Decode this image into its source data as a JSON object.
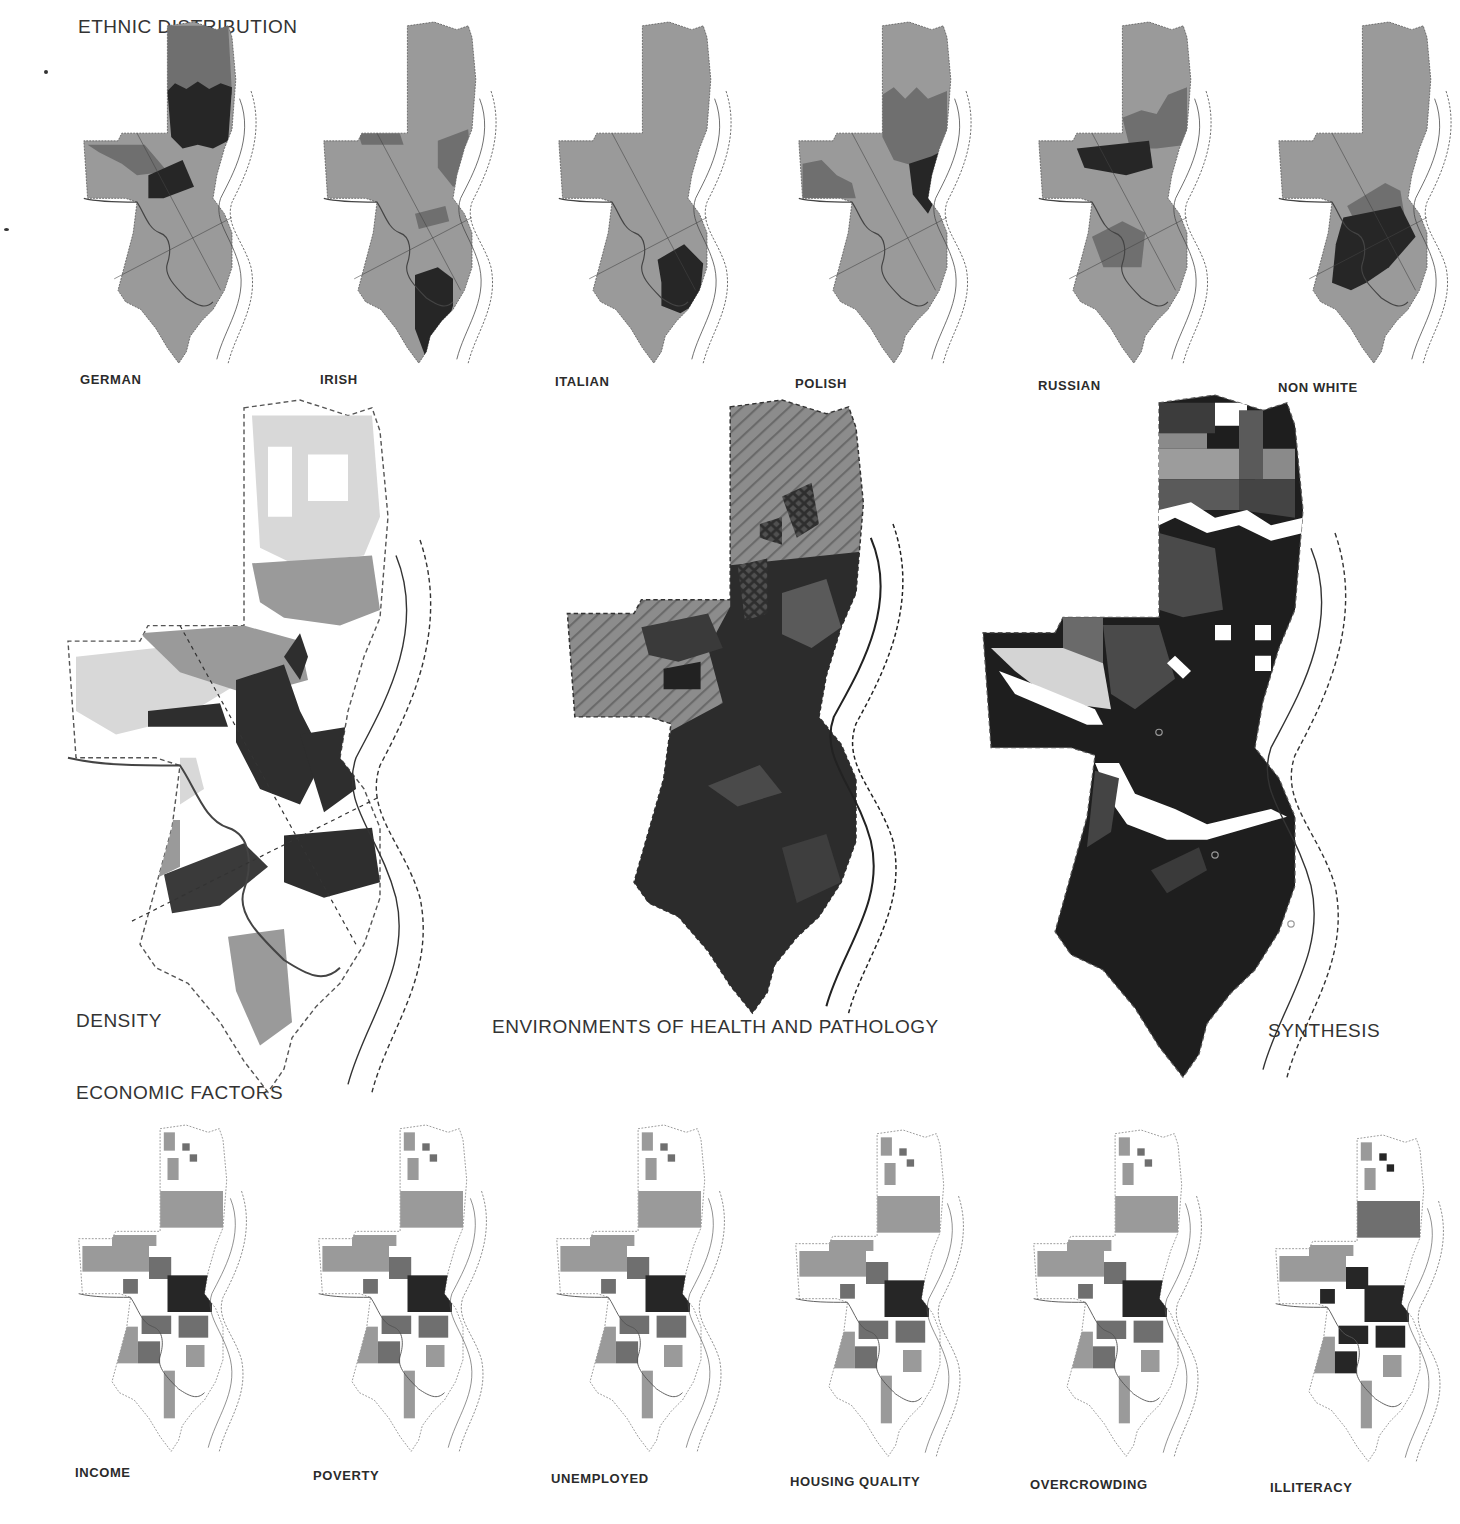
{
  "colors": {
    "paper": "#ffffff",
    "base_gray": "#9a9a9a",
    "mid_gray": "#6f6f6f",
    "dark": "#262626",
    "light": "#d6d6d6",
    "outline": "#555555",
    "river": "#444444"
  },
  "sections": {
    "ethnic": {
      "title": "ETHNIC DISTRIBUTION"
    },
    "density": {
      "title": "DENSITY"
    },
    "health": {
      "title": "ENVIRONMENTS OF HEALTH AND PATHOLOGY"
    },
    "synthesis": {
      "title": "SYNTHESIS"
    },
    "economic": {
      "title": "ECONOMIC FACTORS"
    }
  },
  "ethnic_maps": [
    {
      "label": "GERMAN",
      "x": 80,
      "y": 22,
      "label_x": 80,
      "label_y": 372,
      "regions": [
        {
          "shade": "mid_gray",
          "points": "46,2 78,2 80,38 46,38"
        },
        {
          "shade": "dark",
          "points": "46,36 50,32 56,35 62,31 68,35 74,32 80,34 78,62 70,66 62,64 54,66 48,60"
        },
        {
          "shade": "mid_gray",
          "points": "4,64 34,64 46,78 30,80 22,74 10,68"
        },
        {
          "shade": "dark",
          "points": "36,80 54,72 60,86 44,92 36,92"
        }
      ]
    },
    {
      "label": "IRISH",
      "x": 320,
      "y": 22,
      "label_x": 320,
      "label_y": 372,
      "regions": [
        {
          "shade": "mid_gray",
          "points": "20,58 42,58 44,64 22,64"
        },
        {
          "shade": "mid_gray",
          "points": "62,62 78,56 80,82 70,86 62,76"
        },
        {
          "shade": "mid_gray",
          "points": "50,100 66,96 68,104 52,108"
        },
        {
          "shade": "dark",
          "points": "50,132 62,128 70,134 70,148 64,168 56,176 50,160"
        }
      ]
    },
    {
      "label": "ITALIAN",
      "x": 555,
      "y": 22,
      "label_x": 555,
      "label_y": 374,
      "regions": [
        {
          "shade": "dark",
          "points": "54,124 68,116 78,126 76,146 66,152 56,148 56,136"
        }
      ]
    },
    {
      "label": "POLISH",
      "x": 795,
      "y": 22,
      "label_x": 795,
      "label_y": 376,
      "regions": [
        {
          "shade": "mid_gray",
          "points": "46,38 52,34 58,40 64,34 70,40 80,36 80,66 66,76 52,72 46,60"
        },
        {
          "shade": "dark",
          "points": "60,74 72,70 80,66 78,84 70,100 62,90"
        },
        {
          "shade": "mid_gray",
          "points": "4,74 14,72 22,80 30,84 32,92 4,92"
        }
      ]
    },
    {
      "label": "RUSSIAN",
      "x": 1035,
      "y": 22,
      "label_x": 1038,
      "label_y": 378,
      "regions": [
        {
          "shade": "mid_gray",
          "points": "46,50 56,46 64,48 70,38 80,34 80,64 64,66 50,66"
        },
        {
          "shade": "dark",
          "points": "22,66 60,62 62,76 48,80 26,76"
        },
        {
          "shade": "mid_gray",
          "points": "30,112 46,104 58,110 56,128 36,128"
        }
      ]
    },
    {
      "label": "NON WHITE",
      "x": 1275,
      "y": 22,
      "label_x": 1278,
      "label_y": 380,
      "regions": [
        {
          "shade": "mid_gray",
          "points": "38,96 58,84 66,88 68,100 44,108"
        },
        {
          "shade": "dark",
          "points": "36,102 66,96 74,112 60,128 48,136 40,140 30,136 32,116"
        }
      ]
    }
  ],
  "economic_maps": [
    {
      "label": "INCOME",
      "x": 75,
      "y": 1125,
      "label_x": 75,
      "label_y": 1465,
      "intensity": 0.35
    },
    {
      "label": "POVERTY",
      "x": 315,
      "y": 1125,
      "label_x": 313,
      "label_y": 1468,
      "intensity": 0.55
    },
    {
      "label": "UNEMPLOYED",
      "x": 553,
      "y": 1125,
      "label_x": 551,
      "label_y": 1471,
      "intensity": 0.45
    },
    {
      "label": "HOUSING QUALITY",
      "x": 792,
      "y": 1130,
      "label_x": 790,
      "label_y": 1474,
      "intensity": 0.4
    },
    {
      "label": "OVERCROWDING",
      "x": 1030,
      "y": 1130,
      "label_x": 1030,
      "label_y": 1477,
      "intensity": 0.45
    },
    {
      "label": "ILLITERACY",
      "x": 1272,
      "y": 1135,
      "label_x": 1270,
      "label_y": 1480,
      "intensity": 0.8
    }
  ]
}
